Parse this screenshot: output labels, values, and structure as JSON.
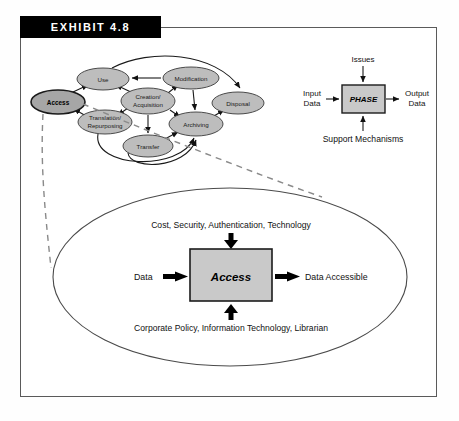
{
  "exhibit": {
    "label": "EXHIBIT 4.8"
  },
  "lifecycle_diagram": {
    "name": "data-lifecycle-diagram",
    "nodes": [
      {
        "id": "access",
        "label": "Access",
        "emphasis": "bold",
        "cx": 58,
        "cy": 102,
        "rx": 27,
        "ry": 12
      },
      {
        "id": "use",
        "label": "Use",
        "emphasis": "normal",
        "cx": 103,
        "cy": 79,
        "rx": 26,
        "ry": 11
      },
      {
        "id": "translation",
        "label_line1": "Translation/",
        "label_line2": "Repurposing",
        "emphasis": "normal",
        "cx": 105,
        "cy": 122,
        "rx": 27,
        "ry": 12
      },
      {
        "id": "creation",
        "label_line1": "Creation/",
        "label_line2": "Acquisition",
        "emphasis": "normal",
        "cx": 148,
        "cy": 101,
        "rx": 27,
        "ry": 13
      },
      {
        "id": "modification",
        "label": "Modification",
        "emphasis": "normal",
        "cx": 191,
        "cy": 78,
        "rx": 28,
        "ry": 11
      },
      {
        "id": "archiving",
        "label": "Archiving",
        "emphasis": "normal",
        "cx": 196,
        "cy": 124,
        "rx": 27,
        "ry": 12
      },
      {
        "id": "transfer",
        "label": "Transfer",
        "emphasis": "normal",
        "cx": 148,
        "cy": 146,
        "rx": 25,
        "ry": 11
      },
      {
        "id": "disposal",
        "label": "Disposal",
        "emphasis": "normal",
        "cx": 238,
        "cy": 103,
        "rx": 26,
        "ry": 11
      }
    ]
  },
  "phase_diagram": {
    "name": "phase-idef-diagram",
    "box_label": "PHASE",
    "top_label": "Issues",
    "left_label_line1": "Input",
    "left_label_line2": "Data",
    "right_label_line1": "Output",
    "right_label_line2": "Data",
    "bottom_label": "Support Mechanisms"
  },
  "access_detail": {
    "name": "access-detail-diagram",
    "box_label": "Access",
    "top_label": "Cost, Security, Authentication, Technology",
    "bottom_label": "Corporate Policy, Information Technology, Librarian",
    "input_label": "Data",
    "output_label": "Data Accessible"
  },
  "colors": {
    "header_bar": "#000000",
    "header_text": "#ffffff",
    "oval_fill": "#bdbdbd",
    "oval_fill_dark": "#a6a6a6",
    "box_fill": "#c9c9c9",
    "frame_border": "#5a5a5a",
    "dash_link": "#8a8a8a"
  }
}
